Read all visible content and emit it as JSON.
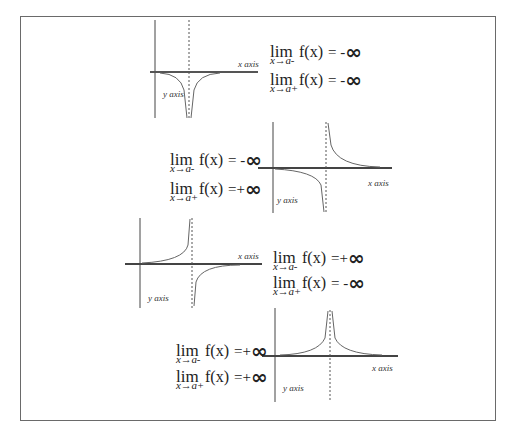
{
  "figure": {
    "frame_color": "#6a6a6a",
    "curve_color": "#555555",
    "axis_color": "#333333",
    "asymptote_style": "dashed"
  },
  "graphs": [
    {
      "id": "graph-1",
      "x_label": "x axis",
      "y_label": "y axis",
      "behavior": "both sides approach -infinity",
      "limits": [
        {
          "lim": "lim",
          "sub": "x→a-",
          "fx": "f(x)",
          "eq": "= -",
          "inf": "∞"
        },
        {
          "lim": "lim",
          "sub": "x→a+",
          "fx": "f(x)",
          "eq": "= -",
          "inf": "∞"
        }
      ]
    },
    {
      "id": "graph-2",
      "x_label": "x axis",
      "y_label": "y axis",
      "behavior": "left side -infinity, right side +infinity",
      "limits": [
        {
          "lim": "lim",
          "sub": "x→a-",
          "fx": "f(x)",
          "eq": "= -",
          "inf": "∞"
        },
        {
          "lim": "lim",
          "sub": "x→a+",
          "fx": "f(x)",
          "eq": " =+",
          "inf": "∞"
        }
      ]
    },
    {
      "id": "graph-3",
      "x_label": "x axis",
      "y_label": "y axis",
      "behavior": "left side +infinity, right side -infinity",
      "limits": [
        {
          "lim": "lim",
          "sub": "x→a-",
          "fx": "f(x)",
          "eq": " =+",
          "inf": "∞"
        },
        {
          "lim": "lim",
          "sub": "x→a+",
          "fx": "f(x)",
          "eq": "= -",
          "inf": "∞"
        }
      ]
    },
    {
      "id": "graph-4",
      "x_label": "x axis",
      "y_label": "y axis",
      "behavior": "both sides approach +infinity",
      "limits": [
        {
          "lim": "lim",
          "sub": "x→a-",
          "fx": "f(x)",
          "eq": " =+",
          "inf": "∞"
        },
        {
          "lim": "lim",
          "sub": "x→a+",
          "fx": "f(x)",
          "eq": " =+",
          "inf": "∞"
        }
      ]
    }
  ]
}
